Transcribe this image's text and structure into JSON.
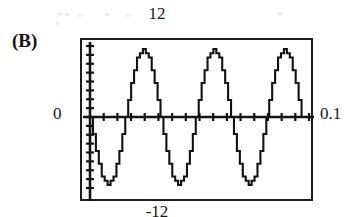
{
  "figure": {
    "panel_letter": "(B)",
    "labels": {
      "top": "12",
      "bottom": "-12",
      "left": "0",
      "right": "0.1"
    }
  },
  "chart_data": {
    "type": "line",
    "title": "(B)",
    "subtitle": "",
    "xlabel": "",
    "ylabel": "",
    "xlim": [
      0,
      0.1
    ],
    "ylim": [
      -12,
      12
    ],
    "x_tick_labels": [
      "0",
      "0.1"
    ],
    "y_tick_labels": [
      "-12",
      "12"
    ],
    "grid": false,
    "legend": null,
    "waveform": {
      "shape": "stepped-sine",
      "description": "quantized (staircase) sinusoid, inverted phase, starts at 0 and goes negative first",
      "amplitude": 11.5,
      "cycles": 3.1,
      "period_seconds": 0.0322,
      "frequency_hz": 31,
      "phase_deg": 180,
      "quantization_steps": 16,
      "samples_per_cycle": 24
    },
    "series": [
      {
        "name": "stepped sine",
        "color": "#111111",
        "x": [
          0,
          0.0042,
          0.0083,
          0.0125,
          0.0167,
          0.0208,
          0.025,
          0.0292,
          0.0333,
          0.0375,
          0.0417,
          0.0458,
          0.05,
          0.0542,
          0.0583,
          0.0625,
          0.0667,
          0.0708,
          0.075,
          0.0792,
          0.0833,
          0.0875,
          0.0917,
          0.0958,
          0.1
        ],
        "values": [
          0,
          -8.1,
          -11.5,
          -8.1,
          0,
          8.1,
          11.5,
          8.1,
          0,
          -8.1,
          -11.5,
          -8.1,
          0,
          8.1,
          11.5,
          8.1,
          0,
          -8.1,
          -11.5,
          -8.1,
          0,
          8.1,
          11.5,
          8.1,
          0
        ]
      }
    ],
    "axes": {
      "x_axis_drawn": true,
      "y_axis_drawn": true,
      "x_axis_at_y": 0,
      "y_axis_at_x": 0,
      "x_tick_count": 16,
      "y_tick_count": 16
    }
  }
}
